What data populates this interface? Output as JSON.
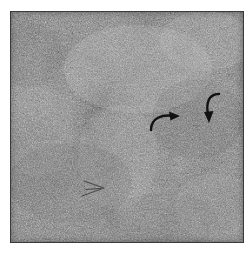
{
  "figure": {
    "type": "micrograph",
    "modality": "grayscale electron micrograph",
    "alt_text": "Grainy grayscale electron micrograph of a fibrous matrix with lighter and darker patches, marked by three arrows",
    "canvas": {
      "width": 252,
      "height": 254
    },
    "plate": {
      "x": 10,
      "y": 11,
      "width": 234,
      "height": 232,
      "background_color": "#8d8d8d",
      "border_color": "#4a4a4a",
      "page_background": "#ffffff"
    },
    "texture": {
      "description": "fine granular speckle with diffuse lighter and darker patches",
      "mean_gray": "#8f8f8f",
      "light_patch_color": "#c2c2c2",
      "dark_patch_color": "#5e5e5e",
      "grain_scale": "fine"
    },
    "annotations": [
      {
        "id": "arrow-curved-right",
        "label": "curved arrow pointing right",
        "style": "solid",
        "color": "#121212",
        "x": 150,
        "y": 110,
        "width": 32,
        "height": 22,
        "direction": "right"
      },
      {
        "id": "arrow-curved-down",
        "label": "curved arrow pointing down",
        "style": "solid",
        "color": "#121212",
        "x": 203,
        "y": 92,
        "width": 22,
        "height": 34,
        "direction": "down"
      },
      {
        "id": "arrow-outline-right",
        "label": "outlined arrowhead pointing right",
        "style": "outline",
        "color": "#3c3c3c",
        "x": 78,
        "y": 180,
        "width": 30,
        "height": 20,
        "direction": "right"
      }
    ]
  },
  "chart_data": {
    "type": "heatmap",
    "title": "",
    "xlabel": "",
    "ylabel": "",
    "legend": [],
    "grid": false,
    "colormap": "grayscale",
    "value_range": [
      0,
      255
    ]
  }
}
